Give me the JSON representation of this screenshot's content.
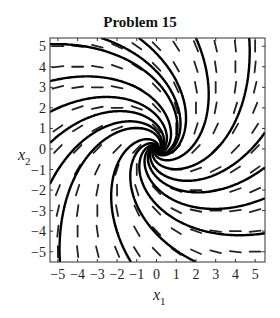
{
  "chart_data": {
    "type": "line",
    "subtype": "phase-portrait",
    "title": "Problem 15",
    "xlabel": "x_1",
    "ylabel": "x_2",
    "xlabel_main": "x",
    "xlabel_sub": "1",
    "ylabel_main": "x",
    "ylabel_sub": "2",
    "xlim": [
      -5.4,
      5.5
    ],
    "ylim": [
      -5.5,
      5.4
    ],
    "xticks": [
      -5,
      -4,
      -3,
      -2,
      -1,
      0,
      1,
      2,
      3,
      4,
      5
    ],
    "yticks": [
      -5,
      -4,
      -3,
      -2,
      -1,
      0,
      1,
      2,
      3,
      4,
      5
    ],
    "xtick_labels": [
      "−5",
      "−4",
      "−3",
      "−2",
      "−1",
      "0",
      "1",
      "2",
      "3",
      "4",
      "5"
    ],
    "ytick_labels": [
      "−5",
      "−4",
      "−3",
      "−2",
      "−1",
      "0",
      "1",
      "2",
      "3",
      "4",
      "5"
    ],
    "grid": false,
    "legend": null,
    "system": {
      "description": "linear system x' = A x, stable spiral at origin",
      "A": [
        [
          -1,
          1
        ],
        [
          -1,
          -1
        ]
      ]
    },
    "direction_field": {
      "type": "line-segments",
      "x": [
        -5,
        -4,
        -3,
        -2,
        -1,
        0,
        1,
        2,
        3,
        4,
        5
      ],
      "y": [
        -5,
        -4,
        -3,
        -2,
        -1,
        0,
        1,
        2,
        3,
        4,
        5
      ]
    },
    "trajectories": {
      "count": 16,
      "seeds": [
        [
          -5.4,
          5.1
        ],
        [
          -5.4,
          3.3
        ],
        [
          -5.4,
          1.8
        ],
        [
          -5.4,
          0.3
        ],
        [
          -5.4,
          -1.7
        ],
        [
          -4.9,
          -5.5
        ],
        [
          -1.3,
          -5.5
        ],
        [
          2.0,
          -5.5
        ],
        [
          5.5,
          -4.1
        ],
        [
          5.5,
          -2.4
        ],
        [
          5.5,
          -0.9
        ],
        [
          5.5,
          0.8
        ],
        [
          4.7,
          5.4
        ],
        [
          2.0,
          5.4
        ],
        [
          -0.9,
          5.4
        ],
        [
          -2.8,
          5.4
        ]
      ]
    },
    "colors": {
      "trajectory": "#000000",
      "field": "#222222",
      "axes": "#333333"
    }
  }
}
